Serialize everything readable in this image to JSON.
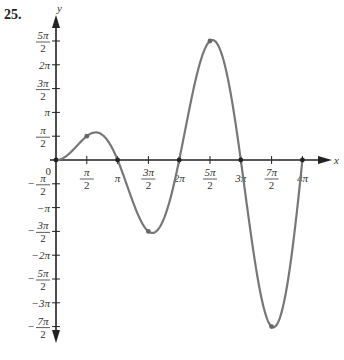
{
  "problem_number": "25.",
  "chart_data": {
    "type": "line",
    "function": "y = x sin x",
    "title": "",
    "xlabel": "x",
    "ylabel": "y",
    "xlim": [
      0,
      12.566
    ],
    "ylim": [
      -11.0,
      8.2
    ],
    "grid": false,
    "x_tick_labels": [
      "π/2",
      "π",
      "3π/2",
      "2π",
      "5π/2",
      "3π",
      "7π/2",
      "4π"
    ],
    "y_tick_labels": [
      "5π/2",
      "2π",
      "3π/2",
      "π",
      "π/2",
      "-π/2",
      "-π",
      "-3π/2",
      "-2π",
      "-5π/2",
      "-3π",
      "-7π/2"
    ],
    "origin_label": "0",
    "marked_points": [
      {
        "x": "0",
        "y": "0"
      },
      {
        "x": "π/2",
        "y": "π/2"
      },
      {
        "x": "π",
        "y": "0"
      },
      {
        "x": "3π/2",
        "y": "-3π/2"
      },
      {
        "x": "2π",
        "y": "0"
      },
      {
        "x": "5π/2",
        "y": "5π/2"
      },
      {
        "x": "3π",
        "y": "0"
      },
      {
        "x": "7π/2",
        "y": "-7π/2"
      },
      {
        "x": "4π",
        "y": "0"
      }
    ],
    "curve_color": "#777777",
    "axis_color": "#222222"
  }
}
